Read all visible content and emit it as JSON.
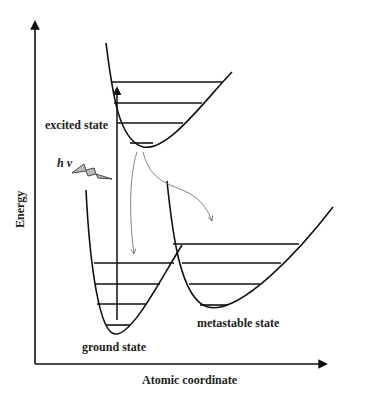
{
  "diagram": {
    "axes": {
      "y_label": "Energy",
      "x_label": "Atomic coordinate"
    },
    "states": {
      "excited": {
        "label": "excited state",
        "vibrational_levels": 4
      },
      "ground": {
        "label": "ground state",
        "vibrational_levels": 4
      },
      "metastable": {
        "label": "metastable state",
        "vibrational_levels": 4
      }
    },
    "excitation": {
      "symbol": "h ν",
      "icon": "lightning-bolt-icon"
    },
    "transitions": [
      {
        "from": "excited state",
        "to": "ground state",
        "style": "gray curved arrow"
      },
      {
        "from": "excited state",
        "to": "metastable state",
        "style": "gray curved arrow"
      },
      {
        "from": "ground state",
        "to": "excited state",
        "style": "black vertical arrow (absorption)"
      }
    ],
    "colors": {
      "line": "#111111",
      "transition": "#777777",
      "bolt_fill": "#bbbbbb"
    }
  }
}
